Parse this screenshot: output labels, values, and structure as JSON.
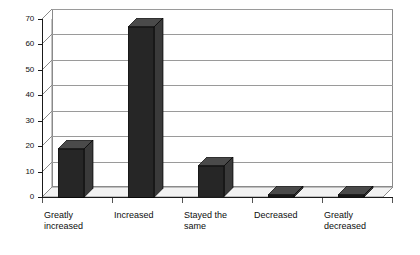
{
  "chart_data": {
    "type": "bar",
    "title": "",
    "subtitle": "",
    "xlabel": "",
    "ylabel": "",
    "categories": [
      "Greatly\nincreased",
      "Increased",
      "Stayed the\nsame",
      "Decreased",
      "Greatly\ndecreased"
    ],
    "values": [
      19,
      67,
      12,
      0.6,
      0.6
    ],
    "ylim": [
      0,
      70
    ],
    "yticks": [
      0,
      10,
      20,
      30,
      40,
      50,
      60,
      70
    ],
    "ytick_labels": [
      "0",
      "10",
      "20",
      "30",
      "40",
      "50",
      "60",
      "70"
    ],
    "grid": true,
    "grid_axis": "y",
    "legend": false,
    "legend_position": "none",
    "style": "3d-column",
    "bar_color": "#262626",
    "bar_top_color": "#4a4a4a",
    "bar_side_color": "#3a3a3a",
    "grid_color": "#9a9a9a",
    "axis_color": "#1a1a1a",
    "plot_background": "#ffffff",
    "figure_background": "#ffffff",
    "annotations": []
  },
  "axes": {
    "y_tick_labels": [
      "70",
      "60",
      "50",
      "40",
      "30",
      "20",
      "10",
      "0"
    ]
  }
}
